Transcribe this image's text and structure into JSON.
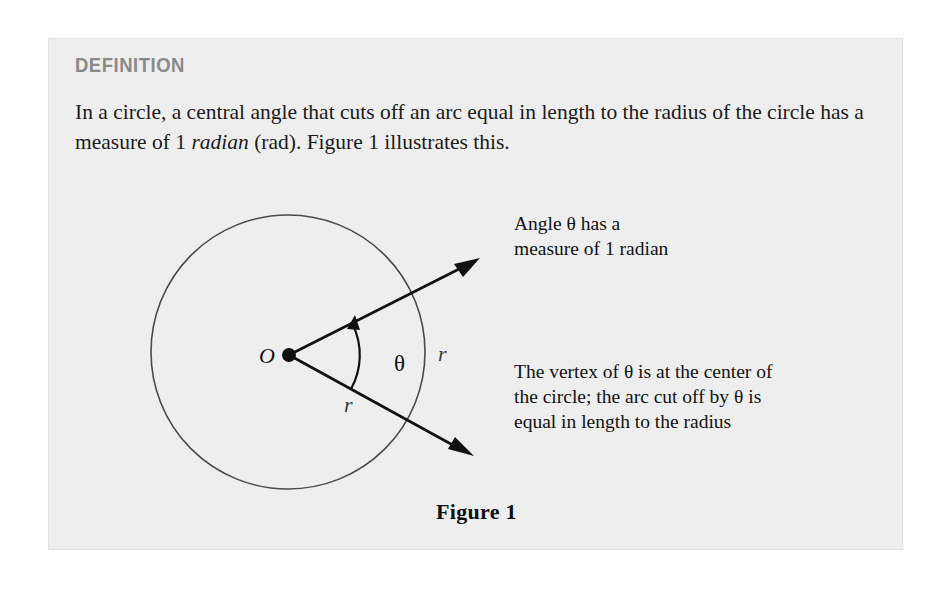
{
  "panel": {
    "heading": "DEFINITION",
    "body_part1": "In a circle, a central angle that cuts off an arc equal in length to the radius of the circle has a measure of 1 ",
    "body_italic": "radian",
    "body_part2": " (rad). Figure 1 illustrates this.",
    "background_color": "#eeeeee",
    "heading_color": "#8a8a8a",
    "text_color": "#1b1b1b"
  },
  "figure": {
    "caption": "Figure 1",
    "center_label": "O",
    "angle_label": "θ",
    "radius_label_right": "r",
    "radius_label_inner": "r",
    "annotation_angle": {
      "line1": "Angle θ has a",
      "line2": "measure of 1 radian"
    },
    "annotation_vertex": {
      "line1": "The vertex of θ is at the center of",
      "line2": "the circle; the arc cut off by θ is",
      "line3": "equal in length to the radius"
    },
    "stroke_color": "#4a4a4a",
    "ray_color": "#111111"
  },
  "geometry": {
    "circle_center_x": 239,
    "circle_center_y": 313,
    "circle_radius": 137,
    "vertex_x": 240,
    "vertex_y": 316,
    "ray_upper_tip_x": 424,
    "ray_upper_tip_y": 220,
    "ray_lower_tip_x": 417,
    "ray_lower_tip_y": 417
  }
}
